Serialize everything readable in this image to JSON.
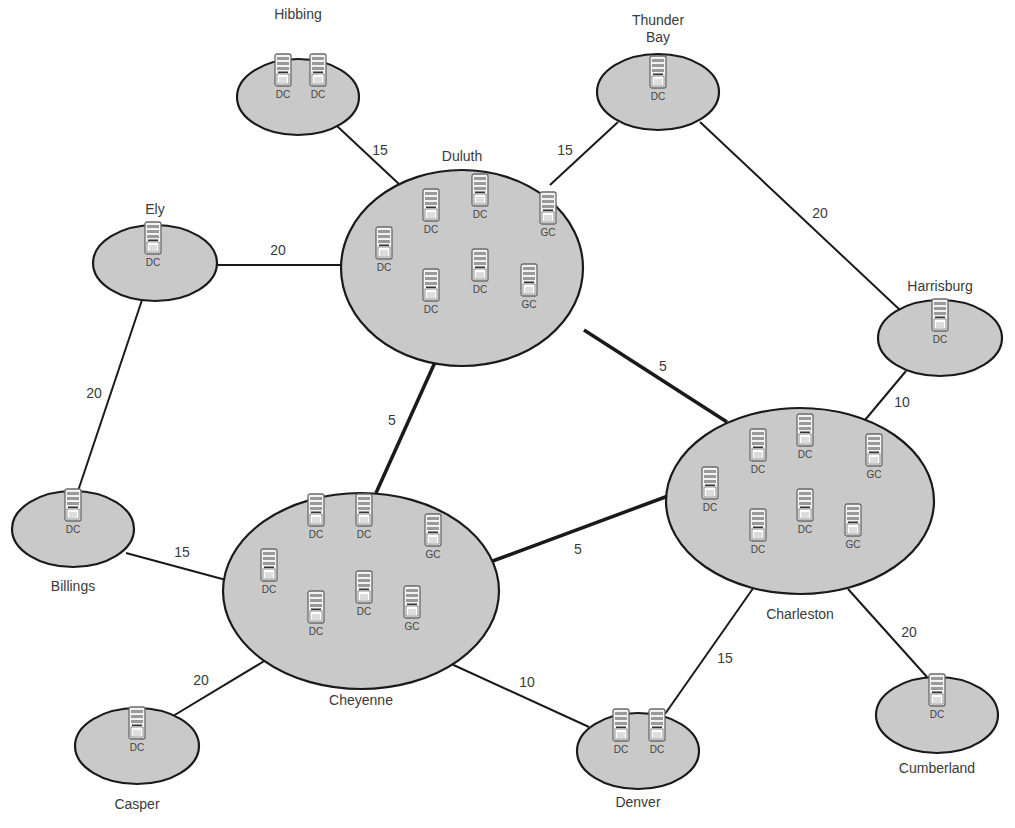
{
  "colors": {
    "site_fill": "#c9c9c9",
    "site_stroke": "#1a1a1a",
    "link_stroke": "#1a1a1a",
    "server_body": "#f2f2f2",
    "server_stroke": "#6a6a6a"
  },
  "sites": [
    {
      "id": "hibbing",
      "name": "Hibbing",
      "cx": 298,
      "cy": 97,
      "rx": 61,
      "ry": 38,
      "label_x": 298,
      "label_y": 6,
      "servers": [
        {
          "role": "DC",
          "x": 283,
          "y": 70
        },
        {
          "role": "DC",
          "x": 318,
          "y": 70
        }
      ]
    },
    {
      "id": "thunderbay",
      "name": "Thunder\nBay",
      "cx": 658,
      "cy": 92,
      "rx": 61,
      "ry": 38,
      "label_x": 658,
      "label_y": 12,
      "servers": [
        {
          "role": "DC",
          "x": 658,
          "y": 72
        }
      ]
    },
    {
      "id": "ely",
      "name": "Ely",
      "cx": 155,
      "cy": 263,
      "rx": 62,
      "ry": 38,
      "label_x": 155,
      "label_y": 201,
      "servers": [
        {
          "role": "DC",
          "x": 153,
          "y": 238
        }
      ]
    },
    {
      "id": "duluth",
      "name": "Duluth",
      "cx": 462,
      "cy": 268,
      "rx": 121,
      "ry": 98,
      "label_x": 462,
      "label_y": 148,
      "servers": [
        {
          "role": "DC",
          "x": 431,
          "y": 205
        },
        {
          "role": "DC",
          "x": 480,
          "y": 190
        },
        {
          "role": "GC",
          "x": 548,
          "y": 208
        },
        {
          "role": "DC",
          "x": 384,
          "y": 243
        },
        {
          "role": "DC",
          "x": 431,
          "y": 285
        },
        {
          "role": "DC",
          "x": 480,
          "y": 265
        },
        {
          "role": "GC",
          "x": 529,
          "y": 280
        }
      ]
    },
    {
      "id": "harrisburg",
      "name": "Harrisburg",
      "cx": 940,
      "cy": 338,
      "rx": 62,
      "ry": 38,
      "label_x": 940,
      "label_y": 278,
      "servers": [
        {
          "role": "DC",
          "x": 940,
          "y": 315
        }
      ]
    },
    {
      "id": "billings",
      "name": "Billings",
      "cx": 73,
      "cy": 529,
      "rx": 61,
      "ry": 38,
      "label_x": 73,
      "label_y": 578,
      "servers": [
        {
          "role": "DC",
          "x": 73,
          "y": 505
        }
      ]
    },
    {
      "id": "cheyenne",
      "name": "Cheyenne",
      "cx": 361,
      "cy": 591,
      "rx": 138,
      "ry": 98,
      "label_x": 361,
      "label_y": 692,
      "servers": [
        {
          "role": "DC",
          "x": 316,
          "y": 510
        },
        {
          "role": "DC",
          "x": 364,
          "y": 510
        },
        {
          "role": "GC",
          "x": 433,
          "y": 530
        },
        {
          "role": "DC",
          "x": 269,
          "y": 565
        },
        {
          "role": "DC",
          "x": 316,
          "y": 607
        },
        {
          "role": "DC",
          "x": 364,
          "y": 587
        },
        {
          "role": "GC",
          "x": 412,
          "y": 602
        }
      ]
    },
    {
      "id": "charleston",
      "name": "Charleston",
      "cx": 800,
      "cy": 501,
      "rx": 134,
      "ry": 93,
      "label_x": 800,
      "label_y": 606,
      "servers": [
        {
          "role": "DC",
          "x": 758,
          "y": 445
        },
        {
          "role": "DC",
          "x": 805,
          "y": 430
        },
        {
          "role": "GC",
          "x": 874,
          "y": 450
        },
        {
          "role": "DC",
          "x": 710,
          "y": 483
        },
        {
          "role": "DC",
          "x": 758,
          "y": 525
        },
        {
          "role": "DC",
          "x": 805,
          "y": 505
        },
        {
          "role": "GC",
          "x": 853,
          "y": 520
        }
      ]
    },
    {
      "id": "casper",
      "name": "Casper",
      "cx": 137,
      "cy": 746,
      "rx": 62,
      "ry": 38,
      "label_x": 137,
      "label_y": 796,
      "servers": [
        {
          "role": "DC",
          "x": 137,
          "y": 723
        }
      ]
    },
    {
      "id": "denver",
      "name": "Denver",
      "cx": 638,
      "cy": 751,
      "rx": 61,
      "ry": 38,
      "label_x": 638,
      "label_y": 794,
      "servers": [
        {
          "role": "DC",
          "x": 621,
          "y": 725
        },
        {
          "role": "DC",
          "x": 657,
          "y": 725
        }
      ]
    },
    {
      "id": "cumberland",
      "name": "Cumberland",
      "cx": 937,
      "cy": 715,
      "rx": 61,
      "ry": 38,
      "label_x": 937,
      "label_y": 760,
      "servers": [
        {
          "role": "DC",
          "x": 937,
          "y": 690
        }
      ]
    }
  ],
  "links": [
    {
      "from": "hibbing",
      "to": "duluth",
      "cost": "15",
      "x1": 337,
      "y1": 126,
      "x2": 400,
      "y2": 185,
      "w": 2,
      "lx": 380,
      "ly": 150
    },
    {
      "from": "thunderbay",
      "to": "duluth",
      "cost": "15",
      "x1": 618,
      "y1": 122,
      "x2": 550,
      "y2": 185,
      "w": 2,
      "lx": 565,
      "ly": 150
    },
    {
      "from": "thunderbay",
      "to": "harrisburg",
      "cost": "20",
      "x1": 700,
      "y1": 122,
      "x2": 900,
      "y2": 310,
      "w": 2,
      "lx": 820,
      "ly": 213
    },
    {
      "from": "ely",
      "to": "duluth",
      "cost": "20",
      "x1": 217,
      "y1": 265,
      "x2": 341,
      "y2": 265,
      "w": 2,
      "lx": 278,
      "ly": 250
    },
    {
      "from": "ely",
      "to": "billings",
      "cost": "20",
      "x1": 142,
      "y1": 300,
      "x2": 78,
      "y2": 491,
      "w": 2,
      "lx": 94,
      "ly": 393
    },
    {
      "from": "duluth",
      "to": "cheyenne",
      "cost": "5",
      "x1": 436,
      "y1": 360,
      "x2": 376,
      "y2": 493,
      "w": 3.5,
      "lx": 392,
      "ly": 420
    },
    {
      "from": "duluth",
      "to": "charleston",
      "cost": "5",
      "x1": 584,
      "y1": 330,
      "x2": 727,
      "y2": 422,
      "w": 3.5,
      "lx": 663,
      "ly": 366
    },
    {
      "from": "cheyenne",
      "to": "charleston",
      "cost": "5",
      "x1": 490,
      "y1": 562,
      "x2": 668,
      "y2": 496,
      "w": 3.5,
      "lx": 578,
      "ly": 549
    },
    {
      "from": "harrisburg",
      "to": "charleston",
      "cost": "10",
      "x1": 906,
      "y1": 371,
      "x2": 865,
      "y2": 420,
      "w": 2,
      "lx": 902,
      "ly": 402
    },
    {
      "from": "billings",
      "to": "cheyenne",
      "cost": "15",
      "x1": 126,
      "y1": 553,
      "x2": 226,
      "y2": 580,
      "w": 2,
      "lx": 182,
      "ly": 552
    },
    {
      "from": "cheyenne",
      "to": "casper",
      "cost": "20",
      "x1": 266,
      "y1": 660,
      "x2": 173,
      "y2": 716,
      "w": 2,
      "lx": 201,
      "ly": 680
    },
    {
      "from": "cheyenne",
      "to": "denver",
      "cost": "10",
      "x1": 447,
      "y1": 662,
      "x2": 589,
      "y2": 727,
      "w": 2,
      "lx": 527,
      "ly": 682
    },
    {
      "from": "charleston",
      "to": "denver",
      "cost": "15",
      "x1": 754,
      "y1": 587,
      "x2": 665,
      "y2": 714,
      "w": 2,
      "lx": 725,
      "ly": 658
    },
    {
      "from": "charleston",
      "to": "cumberland",
      "cost": "20",
      "x1": 848,
      "y1": 589,
      "x2": 927,
      "y2": 677,
      "w": 2,
      "lx": 909,
      "ly": 632
    }
  ]
}
